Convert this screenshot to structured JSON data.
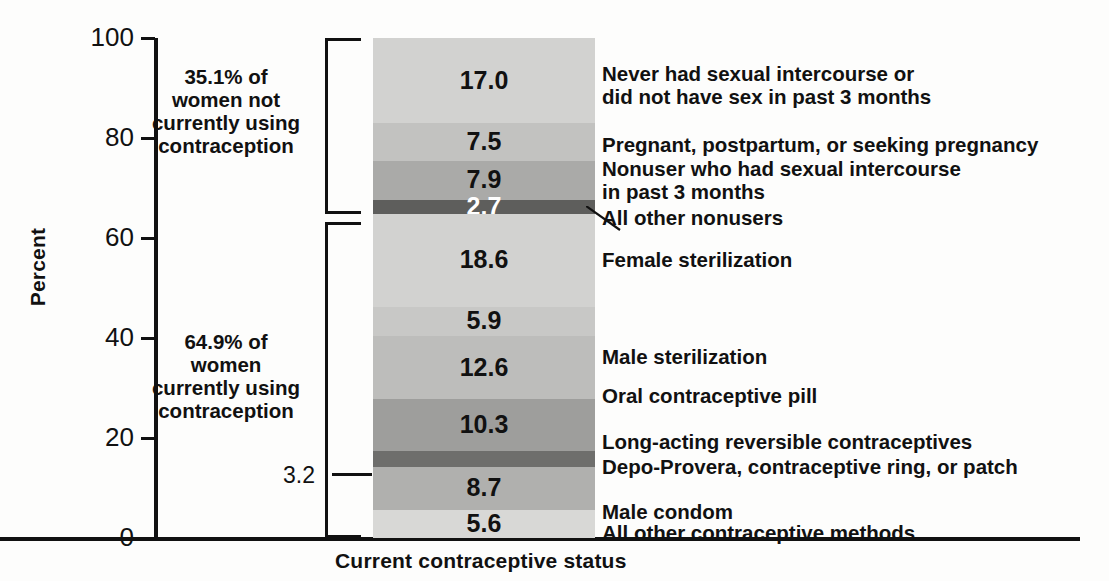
{
  "chart_data": {
    "type": "bar",
    "subtype": "single stacked bar (100%)",
    "title": "",
    "xlabel": "Current contraceptive status",
    "ylabel": "Percent",
    "ylim": [
      0,
      100
    ],
    "yticks": [
      0,
      20,
      40,
      60,
      80,
      100
    ],
    "grid": false,
    "legend": "right-side direct labels",
    "categories": [
      "Current contraceptive status"
    ],
    "stack_order": "top-to-bottom",
    "segments": [
      {
        "label": "Never had sexual intercourse or\ndid not have sex in past 3 months",
        "value": 17.0,
        "value_text": "17.0",
        "group": "not_using",
        "shade": "#d2d2d0",
        "text_color": "dark"
      },
      {
        "label": "Pregnant, postpartum, or seeking pregnancy",
        "value": 7.5,
        "value_text": "7.5",
        "group": "not_using",
        "shade": "#c2c2c0",
        "text_color": "dark"
      },
      {
        "label": "Nonuser who had sexual intercourse\nin past 3 months",
        "value": 7.9,
        "value_text": "7.9",
        "group": "not_using",
        "shade": "#aaaaa8",
        "text_color": "dark"
      },
      {
        "label": "All other nonusers",
        "value": 2.7,
        "value_text": "2.7",
        "group": "not_using",
        "shade": "#5e5e5c",
        "text_color": "light"
      },
      {
        "label": "Female sterilization",
        "value": 18.6,
        "value_text": "18.6",
        "group": "using",
        "shade": "#d2d2d0",
        "text_color": "dark"
      },
      {
        "label": "Male sterilization",
        "value": 5.9,
        "value_text": "5.9",
        "group": "using",
        "shade": "#c8c8c6",
        "text_color": "dark"
      },
      {
        "label": "Oral contraceptive pill",
        "value": 12.6,
        "value_text": "12.6",
        "group": "using",
        "shade": "#bdbdbb",
        "text_color": "dark"
      },
      {
        "label": "Long-acting reversible contraceptives",
        "value": 10.3,
        "value_text": "10.3",
        "group": "using",
        "shade": "#9e9e9c",
        "text_color": "dark"
      },
      {
        "label": "Depo-Provera, contraceptive ring, or patch",
        "value": 3.2,
        "value_text": "3.2",
        "group": "using",
        "shade": "#6e6e6c",
        "text_color": "none",
        "label_outside": true
      },
      {
        "label": "Male condom",
        "value": 8.7,
        "value_text": "8.7",
        "group": "using",
        "shade": "#b0b0ae",
        "text_color": "dark"
      },
      {
        "label": "All other contraceptive methods",
        "value": 5.6,
        "value_text": "5.6",
        "group": "using",
        "shade": "#d8d8d6",
        "text_color": "dark"
      }
    ],
    "annotations": [
      {
        "name": "not-using-group",
        "text": "35.1% of\nwomen not\ncurrently using\ncontraception",
        "value": 35.1,
        "range": [
          64.9,
          100.0
        ]
      },
      {
        "name": "using-group",
        "text": "64.9% of\nwomen\ncurrently using\ncontraception",
        "value": 64.9,
        "range": [
          0.0,
          64.9
        ]
      },
      {
        "name": "depo-callout",
        "text": "3.2"
      }
    ]
  },
  "axes": {
    "y_title": "Percent",
    "x_title": "Current contraceptive status",
    "y_tick_labels": [
      "100",
      "80",
      "60",
      "40",
      "20",
      "0"
    ]
  },
  "groups": {
    "upper": "35.1% of\nwomen not\ncurrently using\ncontraception",
    "lower": "64.9% of\nwomen\ncurrently using\ncontraception"
  },
  "callout": {
    "depo_value": "3.2"
  }
}
